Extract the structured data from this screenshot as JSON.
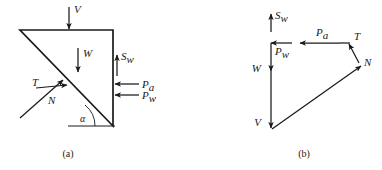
{
  "figure": {
    "panels": [
      {
        "id": "a",
        "caption": "(a)",
        "description": "free-body diagram of wedge",
        "angle_label": "α",
        "forces": [
          {
            "symbol": "V",
            "sub": "",
            "direction": "down",
            "location": "top-face"
          },
          {
            "symbol": "W",
            "sub": "",
            "direction": "down",
            "location": "interior"
          },
          {
            "symbol": "S",
            "sub": "w",
            "direction": "up",
            "location": "vertical-face"
          },
          {
            "symbol": "P",
            "sub": "a",
            "direction": "left",
            "location": "vertical-face-upper"
          },
          {
            "symbol": "P",
            "sub": "w",
            "direction": "left",
            "location": "vertical-face-lower"
          },
          {
            "symbol": "T",
            "sub": "",
            "direction": "up-right",
            "location": "failure-plane"
          },
          {
            "symbol": "N",
            "sub": "",
            "direction": "up-right",
            "location": "failure-plane-normal"
          }
        ]
      },
      {
        "id": "b",
        "caption": "(b)",
        "description": "force polygon",
        "forces": [
          {
            "symbol": "S",
            "sub": "w",
            "direction": "up",
            "location": "polygon-top"
          },
          {
            "symbol": "P",
            "sub": "w",
            "direction": "left",
            "location": "polygon-upper-left"
          },
          {
            "symbol": "P",
            "sub": "a",
            "direction": "left",
            "location": "polygon-top-right"
          },
          {
            "symbol": "T",
            "sub": "",
            "direction": "up-left",
            "location": "polygon-right"
          },
          {
            "symbol": "N",
            "sub": "",
            "direction": "up-right",
            "location": "polygon-lower-right"
          },
          {
            "symbol": "W",
            "sub": "",
            "direction": "down",
            "location": "polygon-left-upper"
          },
          {
            "symbol": "V",
            "sub": "",
            "direction": "down",
            "location": "polygon-left-lower"
          }
        ]
      }
    ],
    "colors": {
      "ink": "#1a1a1a",
      "background": "#ffffff"
    }
  }
}
